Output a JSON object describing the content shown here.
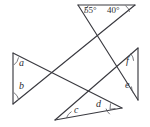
{
  "figure": {
    "background_color": "#ffffff",
    "line_color": "#3a3a40",
    "label_color": "#2e2e33"
  },
  "angles": {
    "top_left_degrees": "55°",
    "top_right_degrees": "40°",
    "left_upper": "a",
    "left_lower": "b",
    "bottom_left": "c",
    "bottom_right": "d",
    "right_lower": "e",
    "right_upper": "f"
  },
  "labels": [
    {
      "id": "angle-55",
      "text": "55°",
      "x": 85,
      "y": 8
    },
    {
      "id": "angle-40",
      "text": "40°",
      "x": 108,
      "y": 8
    },
    {
      "id": "angle-a",
      "text": "a",
      "x": 19,
      "y": 63
    },
    {
      "id": "angle-b",
      "text": "b",
      "x": 19,
      "y": 85
    },
    {
      "id": "angle-c",
      "text": "c",
      "x": 75,
      "y": 108
    },
    {
      "id": "angle-d",
      "text": "d",
      "x": 97,
      "y": 103
    },
    {
      "id": "angle-e",
      "text": "e",
      "x": 126,
      "y": 84
    },
    {
      "id": "angle-f",
      "text": "f",
      "x": 127,
      "y": 60
    }
  ],
  "segments": [
    {
      "id": "top-triangle-base",
      "x1": 78,
      "y1": 5,
      "x2": 135,
      "y2": 5
    },
    {
      "id": "top-triangle-left-side",
      "x1": 78,
      "y1": 5,
      "x2": 104,
      "y2": 41
    },
    {
      "id": "top-triangle-right-side",
      "x1": 135,
      "y1": 5,
      "x2": 104,
      "y2": 41
    },
    {
      "id": "left-triangle-vertical",
      "x1": 13,
      "y1": 53,
      "x2": 13,
      "y2": 104
    },
    {
      "id": "left-triangle-upper-ray",
      "x1": 13,
      "y1": 53,
      "x2": 122,
      "y2": 108
    },
    {
      "id": "left-triangle-lower-ray",
      "x1": 13,
      "y1": 104,
      "x2": 135,
      "y2": 5
    },
    {
      "id": "right-triangle-vertical",
      "x1": 138,
      "y1": 48,
      "x2": 138,
      "y2": 100
    },
    {
      "id": "right-triangle-upper-ray",
      "x1": 138,
      "y1": 48,
      "x2": 55,
      "y2": 120
    },
    {
      "id": "right-triangle-lower-ray",
      "x1": 138,
      "y1": 100,
      "x2": 78,
      "y2": 5
    },
    {
      "id": "bottom-triangle-base",
      "x1": 55,
      "y1": 120,
      "x2": 122,
      "y2": 108
    }
  ]
}
